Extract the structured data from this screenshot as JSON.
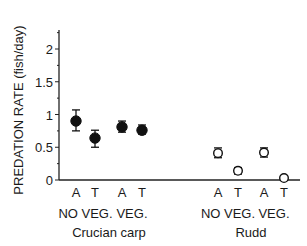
{
  "chart_data": {
    "type": "scatter",
    "title": "",
    "xlabel": "",
    "ylabel": "PREDATION RATE  (fish/day)",
    "ylim": [
      0,
      2.25
    ],
    "yticks": [
      0,
      0.5,
      1,
      1.5,
      2
    ],
    "ytick_labels": [
      "0",
      "0.5",
      "1",
      "1.5",
      "2"
    ],
    "grid": false,
    "legend": null,
    "categories": [
      "A",
      "T",
      "A",
      "T",
      "A",
      "T",
      "A",
      "T"
    ],
    "groups": [
      {
        "label": "NO VEG.",
        "species": "Crucian carp"
      },
      {
        "label": "VEG.",
        "species": "Crucian carp"
      },
      {
        "label": "NO VEG.",
        "species": "Rudd"
      },
      {
        "label": "VEG.",
        "species": "Rudd"
      }
    ],
    "species": [
      "Crucian carp",
      "Rudd"
    ],
    "series": [
      {
        "name": "Crucian carp",
        "marker": "filled-circle",
        "points": [
          {
            "category": "A",
            "group": "NO VEG.",
            "value": 0.9,
            "err_low": 0.75,
            "err_high": 1.07
          },
          {
            "category": "T",
            "group": "NO VEG.",
            "value": 0.64,
            "err_low": 0.5,
            "err_high": 0.76
          },
          {
            "category": "A",
            "group": "VEG.",
            "value": 0.81,
            "err_low": 0.73,
            "err_high": 0.9
          },
          {
            "category": "T",
            "group": "VEG.",
            "value": 0.76,
            "err_low": 0.7,
            "err_high": 0.84
          }
        ]
      },
      {
        "name": "Rudd",
        "marker": "open-circle",
        "points": [
          {
            "category": "A",
            "group": "NO VEG.",
            "value": 0.41,
            "err_low": 0.34,
            "err_high": 0.49
          },
          {
            "category": "T",
            "group": "NO VEG.",
            "value": 0.14,
            "err_low": 0.09,
            "err_high": 0.19
          },
          {
            "category": "A",
            "group": "VEG.",
            "value": 0.42,
            "err_low": 0.35,
            "err_high": 0.49
          },
          {
            "category": "T",
            "group": "VEG.",
            "value": 0.03,
            "err_low": 0.03,
            "err_high": 0.03
          }
        ]
      }
    ]
  }
}
